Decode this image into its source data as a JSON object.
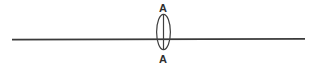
{
  "diagram": {
    "type": "technical-line-diagram",
    "canvas": {
      "width": 316,
      "height": 66,
      "background": "#ffffff"
    },
    "colors": {
      "stroke": "#3a3a3a",
      "ellipse_stroke": "#3f3f3f",
      "text": "#2e2e2e",
      "background": "#ffffff"
    },
    "labels": {
      "top": "A",
      "bottom": "A"
    },
    "elements": {
      "horizontal_line": {
        "name": "section-line",
        "x1": 12,
        "y1": 39.5,
        "x2": 305,
        "y2": 39.0,
        "stroke_width": 1.6
      },
      "ellipse": {
        "name": "lens-outline",
        "cx": 163.5,
        "cy": 32,
        "rx": 6.8,
        "ry": 17.5,
        "stroke_width": 1.2,
        "fill": "none"
      },
      "vertical_line": {
        "name": "ellipse-center-line",
        "x1": 163.5,
        "y1": 14.5,
        "x2": 163.5,
        "y2": 49.5,
        "stroke_width": 1.2
      },
      "label_top_pos": {
        "x": 163,
        "y": 11
      },
      "label_bottom_pos": {
        "x": 163,
        "y": 62
      }
    }
  }
}
